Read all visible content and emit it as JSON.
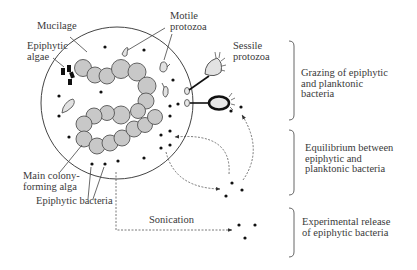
{
  "labels": {
    "mucilage": "Mucilage",
    "epiphytic_algae": [
      "Epiphytic",
      "algae"
    ],
    "motile_protozoa": [
      "Motile",
      "protozoa"
    ],
    "sessile_protozoa": [
      "Sessile",
      "protozoa"
    ],
    "main_colony_alga": [
      "Main colony-",
      "forming alga"
    ],
    "epiphytic_bacteria": "Epiphytic bacteria",
    "sonication": "Sonication"
  },
  "processes": [
    {
      "lines": [
        "Grazing of epiphytic",
        "and planktonic",
        "bacteria"
      ]
    },
    {
      "lines": [
        "Equilibrium between",
        "epiphytic and",
        "planktonic bacteria"
      ]
    },
    {
      "lines": [
        "Experimental release",
        "of epiphytic bacteria"
      ]
    }
  ],
  "colors": {
    "ink": "#333333",
    "alga_fill": "#c8c8c8",
    "protozoa_fill": "#e2e2e2"
  }
}
